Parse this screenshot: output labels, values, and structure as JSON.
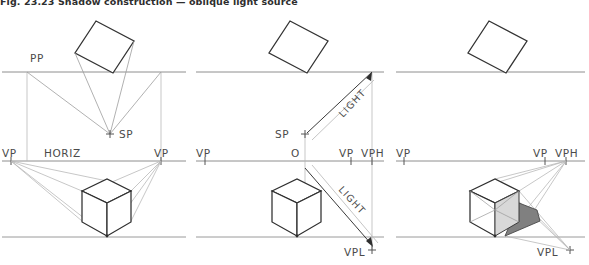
{
  "figure": {
    "caption": "Fig. 23.23  Shadow construction — oblique light source",
    "width": 589,
    "height": 265,
    "panels": [
      {
        "id": "panel-1",
        "name": "plan-and-perspective-setup",
        "labels": {
          "pp": "PP",
          "sp": "SP",
          "vp_left": "VP",
          "vp_right": "VP",
          "horizon": "HORIZ"
        }
      },
      {
        "id": "panel-2",
        "name": "light-direction-setup",
        "labels": {
          "sp": "SP",
          "vp_left": "VP",
          "origin": "O",
          "vp_right": "VP",
          "vph": "VPH",
          "vpl": "VPL",
          "light_upper": "LIGHT",
          "light_lower": "LIGHT"
        }
      },
      {
        "id": "panel-3",
        "name": "completed-shadow",
        "labels": {
          "vp_left": "VP",
          "vp_right": "VP",
          "vph": "VPH",
          "vpl": "VPL"
        }
      }
    ],
    "colors": {
      "line_dark": "#2f2f2f",
      "line_mid": "#8e8e8e",
      "line_light": "#b4b4b4",
      "shadow_fill": "#808080",
      "face_fill": "#d8d8d8",
      "text": "#4a4a4a",
      "background": "#ffffff"
    }
  }
}
